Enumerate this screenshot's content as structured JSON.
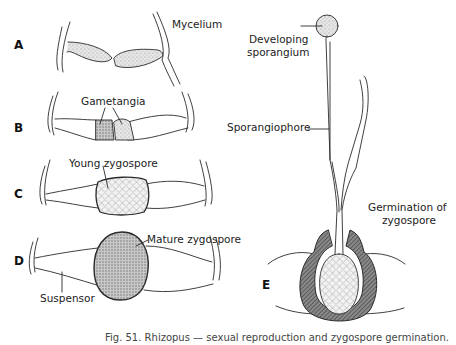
{
  "figure": {
    "panels": {
      "A": "A",
      "B": "B",
      "C": "C",
      "D": "D",
      "E": "E"
    },
    "labels": {
      "mycelium": "Mycelium",
      "gametangia": "Gametangia",
      "young_zygospore": "Young zygospore",
      "mature_zygospore": "Mature zygospore",
      "suspensor": "Suspensor",
      "developing_sporangium_line1": "Developing",
      "developing_sporangium_line2": "sporangium",
      "sporangiophore": "Sporangiophore",
      "germination_line1": "Germination of",
      "germination_line2": "zygospore"
    },
    "caption": "Fig. 51. Rhizopus — sexual reproduction and zygospore germination.",
    "colors": {
      "ink": "#2a2a2a",
      "stipple": "#cfcfcf",
      "dark_stipple": "#a8a8a8",
      "wall": "#6e6e6e",
      "background": "#ffffff"
    }
  }
}
